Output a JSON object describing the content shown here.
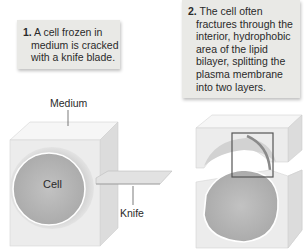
{
  "steps": [
    {
      "number": "1.",
      "lines": [
        "A cell frozen in",
        "medium is cracked",
        "with a knife blade."
      ]
    },
    {
      "number": "2.",
      "lines": [
        "The cell often",
        "fractures through the",
        "interior, hydrophobic",
        "area of the lipid",
        "bilayer, splitting the",
        "plasma membrane",
        "into two layers."
      ]
    }
  ],
  "labels": {
    "medium": "Medium",
    "cell": "Cell",
    "knife": "Knife"
  },
  "colors": {
    "callout_bg": "#e9e9e6",
    "cube_face": "#ececec",
    "cube_top": "#f6f6f6",
    "cube_side": "#dcdcdc",
    "cell_fill": "#b9b9b9",
    "highlight_box": "#555555"
  }
}
